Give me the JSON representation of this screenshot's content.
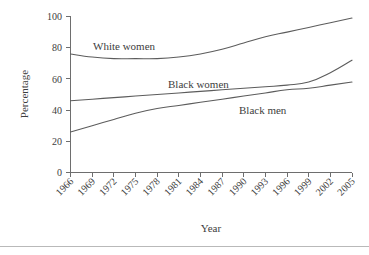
{
  "chart_data": {
    "type": "line",
    "title": "",
    "xlabel": "Year",
    "ylabel": "Percentage",
    "xlim": [
      1966,
      2005
    ],
    "ylim": [
      0,
      100
    ],
    "grid": false,
    "legend_position": "inline-labels",
    "x": [
      1966,
      1969,
      1972,
      1975,
      1978,
      1981,
      1984,
      1987,
      1990,
      1993,
      1996,
      1999,
      2002,
      2005
    ],
    "xtick_labels": [
      "1966",
      "1969",
      "1972",
      "1975",
      "1978",
      "1981",
      "1984",
      "1987",
      "1990",
      "1993",
      "1996",
      "1999",
      "2002",
      "2005"
    ],
    "ytick_labels": [
      "0",
      "20",
      "40",
      "60",
      "80",
      "100"
    ],
    "ytick_values": [
      0,
      20,
      40,
      60,
      80,
      100
    ],
    "series": [
      {
        "name": "White women",
        "label": "White women",
        "values": [
          76,
          74,
          73,
          73,
          73,
          74,
          76,
          79,
          83,
          87,
          90,
          93,
          96,
          99
        ]
      },
      {
        "name": "Black women",
        "label": "Black women",
        "values": [
          46,
          47,
          48,
          49,
          50,
          51,
          52,
          53,
          54,
          55,
          56,
          58,
          64,
          72
        ]
      },
      {
        "name": "Black men",
        "label": "Black men",
        "values": [
          26,
          30,
          34,
          38,
          41,
          43,
          45,
          47,
          49,
          51,
          53,
          54,
          56,
          58
        ]
      }
    ],
    "line_color": "#5c5c5c",
    "axis_color": "#6e6e6e",
    "background_color": "#ffffff"
  },
  "axes": {
    "y_title": "Percentage",
    "x_title": "Year"
  },
  "labels": {
    "white_women": "White women",
    "black_women": "Black women",
    "black_men": "Black men"
  },
  "yticks": {
    "t0": "0",
    "t20": "20",
    "t40": "40",
    "t60": "60",
    "t80": "80",
    "t100": "100"
  },
  "xticks": {
    "x1966": "1966",
    "x1969": "1969",
    "x1972": "1972",
    "x1975": "1975",
    "x1978": "1978",
    "x1981": "1981",
    "x1984": "1984",
    "x1987": "1987",
    "x1990": "1990",
    "x1993": "1993",
    "x1996": "1996",
    "x1999": "1999",
    "x2002": "2002",
    "x2005": "2005"
  }
}
